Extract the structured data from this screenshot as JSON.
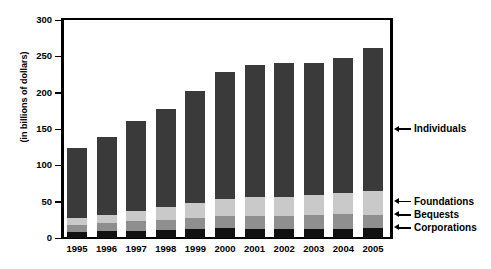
{
  "chart_data": {
    "type": "bar",
    "stacked": true,
    "title": "",
    "xlabel": "",
    "ylabel": "(in billions of dollars)",
    "ylim": [
      0,
      300
    ],
    "yticks": [
      0,
      50,
      100,
      150,
      200,
      250,
      300
    ],
    "grid": false,
    "legend_position": "right-callout",
    "categories": [
      "1995",
      "1996",
      "1997",
      "1998",
      "1999",
      "2000",
      "2001",
      "2002",
      "2003",
      "2004",
      "2005"
    ],
    "series": [
      {
        "name": "Corporations",
        "color": "#111111",
        "values": [
          8,
          9,
          10,
          11,
          12,
          14,
          13,
          12,
          13,
          13,
          14
        ]
      },
      {
        "name": "Bequests",
        "color": "#8f8f8f",
        "values": [
          10,
          11,
          13,
          14,
          16,
          16,
          17,
          18,
          19,
          20,
          18
        ]
      },
      {
        "name": "Foundations",
        "color": "#c9c9c9",
        "values": [
          10,
          12,
          14,
          17,
          20,
          24,
          26,
          27,
          27,
          29,
          33
        ]
      },
      {
        "name": "Individuals",
        "color": "#3a3a3a",
        "values": [
          96,
          107,
          124,
          136,
          154,
          175,
          182,
          184,
          182,
          186,
          196
        ]
      }
    ],
    "totals": [
      124,
      139,
      161,
      178,
      202,
      229,
      238,
      241,
      241,
      248,
      261
    ],
    "callouts": [
      {
        "label": "Individuals",
        "value": 150
      },
      {
        "label": "Foundations",
        "value": 50
      },
      {
        "label": "Bequests",
        "value": 32
      },
      {
        "label": "Corporations",
        "value": 14
      }
    ]
  }
}
